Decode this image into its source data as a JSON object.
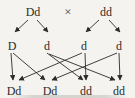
{
  "diagram": {
    "kind": "genetic-cross",
    "background_color": "#f4f3ef",
    "ink_color": "#2d2b28",
    "parents": [
      {
        "label": "Dd"
      },
      {
        "label": "dd"
      }
    ],
    "cross_symbol": "×",
    "gametes": [
      {
        "label": "D"
      },
      {
        "label": "d"
      },
      {
        "label": "d"
      },
      {
        "label": "d"
      }
    ],
    "offspring": [
      {
        "label": "Dd"
      },
      {
        "label": "Dd"
      },
      {
        "label": "dd"
      },
      {
        "label": "dd"
      }
    ],
    "connections": {
      "parent_to_gametes": [
        {
          "from": "Dd",
          "to": [
            "D",
            "d"
          ]
        },
        {
          "from": "dd",
          "to": [
            "d",
            "d"
          ]
        }
      ],
      "gamete_to_offspring": [
        {
          "from": "gamete-1-D",
          "to": "offspring-1-Dd"
        },
        {
          "from": "gamete-1-D",
          "to": "offspring-2-Dd"
        },
        {
          "from": "gamete-2-d",
          "to": "offspring-3-dd"
        },
        {
          "from": "gamete-2-d",
          "to": "offspring-4-dd"
        },
        {
          "from": "gamete-3-d",
          "to": "offspring-1-Dd"
        },
        {
          "from": "gamete-3-d",
          "to": "offspring-3-dd"
        },
        {
          "from": "gamete-4-d",
          "to": "offspring-2-Dd"
        },
        {
          "from": "gamete-4-d",
          "to": "offspring-4-dd"
        }
      ]
    }
  }
}
